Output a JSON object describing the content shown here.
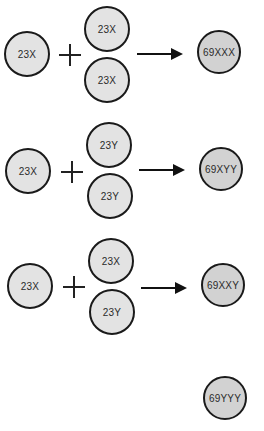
{
  "diagram": {
    "rows": [
      {
        "egg": "23X",
        "sperm_top": "23X",
        "sperm_bottom": "23X",
        "result": "69XXX"
      },
      {
        "egg": "23X",
        "sperm_top": "23Y",
        "sperm_bottom": "23Y",
        "result": "69XYY"
      },
      {
        "egg": "23X",
        "sperm_top": "23X",
        "sperm_bottom": "23Y",
        "result": "69XXY"
      }
    ],
    "extra_result": "69YYY",
    "colors": {
      "gamete_fill": "#e3e3e3",
      "zygote_fill": "#d2d2d2",
      "stroke": "#1a1a1a"
    }
  }
}
